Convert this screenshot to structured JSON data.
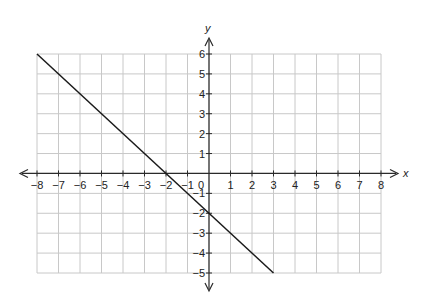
{
  "chart_data": {
    "type": "line",
    "title": "",
    "xlabel": "x",
    "ylabel": "y",
    "xlim": [
      -8,
      8
    ],
    "ylim": [
      -5,
      6
    ],
    "grid": true,
    "legend": null,
    "x_ticks": [
      -8,
      -7,
      -6,
      -5,
      -4,
      -3,
      -2,
      -1,
      0,
      1,
      2,
      3,
      4,
      5,
      6,
      7,
      8
    ],
    "x_tick_labels": [
      "−8",
      "−7",
      "−6",
      "−5",
      "−4",
      "−3",
      "−2",
      "−1",
      "0",
      "1",
      "2",
      "3",
      "4",
      "5",
      "6",
      "7",
      "8"
    ],
    "y_ticks": [
      -5,
      -4,
      -3,
      -2,
      -1,
      1,
      2,
      3,
      4,
      5,
      6
    ],
    "y_tick_labels": [
      "−5",
      "−4",
      "−3",
      "−2",
      "−1",
      "1",
      "2",
      "3",
      "4",
      "5",
      "6"
    ],
    "series": [
      {
        "name": "y = -x - 2",
        "x": [
          -8,
          3
        ],
        "y": [
          6,
          -5
        ],
        "color": "#1a1a1a"
      }
    ],
    "annotations": []
  },
  "layout": {
    "plot_left": 37,
    "plot_right": 381,
    "plot_top": 54,
    "plot_bottom": 273,
    "x_arrow_left": 20,
    "x_arrow_right": 398,
    "y_arrow_top": 38,
    "y_arrow_bottom": 291
  }
}
